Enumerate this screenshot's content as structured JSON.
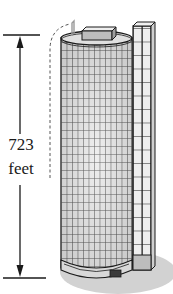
{
  "figure": {
    "height_label": {
      "value": "723",
      "unit": "feet"
    },
    "colors": {
      "line": "#1a1a1a",
      "building_fill": "#d9d9d9",
      "window_light": "#f2f2f2",
      "ground_shadow": "#cfcfcf",
      "door": "#3a3a3a"
    }
  }
}
